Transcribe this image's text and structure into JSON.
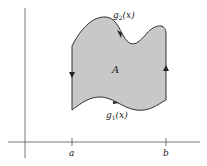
{
  "diagram": {
    "region_label": "A",
    "upper_curve_label": "g",
    "upper_curve_sub": "2",
    "upper_curve_arg": "(x)",
    "lower_curve_label": "g",
    "lower_curve_sub": "1",
    "lower_curve_arg": "(x)",
    "x_ticks": [
      {
        "label": "a"
      },
      {
        "label": "b"
      }
    ],
    "colors": {
      "fill": "#c8c8c8",
      "stroke": "#333333",
      "axis": "#555555"
    },
    "orientation": "counterclockwise"
  }
}
